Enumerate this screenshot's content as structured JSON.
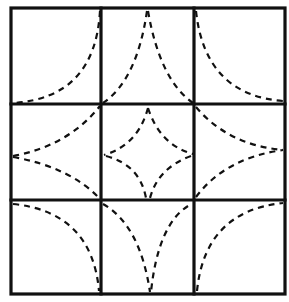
{
  "diagram": {
    "type": "quilt-pattern-grid",
    "grid": {
      "rows": 3,
      "cols": 3
    },
    "colors": {
      "line": "#111111",
      "background": "#ffffff"
    },
    "border": {
      "x": 11,
      "y": 8,
      "w": 274,
      "h": 286
    },
    "verticals": [
      101,
      194
    ],
    "horizontals": [
      104,
      200
    ],
    "curves": [
      {
        "cell": "top-left",
        "d": "M 100 11 Q 95 98 13 103"
      },
      {
        "cell": "top-middle-left",
        "d": "M 147 11 Q 137 80 103 103"
      },
      {
        "cell": "top-middle-right",
        "d": "M 148 11 Q 160 80 193 103"
      },
      {
        "cell": "top-right",
        "d": "M 196 11 Q 205 95 283 101"
      },
      {
        "cell": "middle-left-upper",
        "d": "M 13 156 Q 68 146 100 106"
      },
      {
        "cell": "middle-left-lower",
        "d": "M 13 157 Q 70 167 100 199"
      },
      {
        "cell": "center-top-left",
        "d": "M 148 108 Q 138 145 104 155"
      },
      {
        "cell": "center-top-right",
        "d": "M 148 108 Q 160 145 193 154"
      },
      {
        "cell": "center-bottom-left",
        "d": "M 106 156 Q 140 165 146 198"
      },
      {
        "cell": "center-bottom-right",
        "d": "M 191 156 Q 158 168 150 198"
      },
      {
        "cell": "middle-right-upper",
        "d": "M 196 107 Q 228 145 283 150"
      },
      {
        "cell": "middle-right-lower",
        "d": "M 196 197 Q 225 158 283 150"
      },
      {
        "cell": "bottom-left",
        "d": "M 13 204 Q 92 212 99 291"
      },
      {
        "cell": "bottom-middle-left",
        "d": "M 103 204 Q 140 225 150 292"
      },
      {
        "cell": "bottom-middle-right",
        "d": "M 188 206 Q 158 225 151 292"
      },
      {
        "cell": "bottom-right",
        "d": "M 197 291 Q 205 211 283 203"
      }
    ]
  }
}
